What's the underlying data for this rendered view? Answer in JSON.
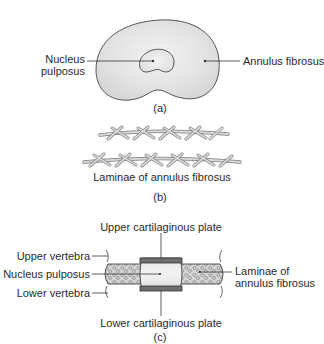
{
  "panel_a": {
    "caption": "(a)",
    "labels": {
      "nucleus_line1": "Nucleus",
      "nucleus_line2": "pulposus",
      "annulus": "Annulus fibrosus"
    },
    "colors": {
      "disc_fill": "#e6e6e6",
      "disc_stroke": "#555555",
      "nucleus_fill": "#ececec"
    }
  },
  "panel_b": {
    "caption": "(b)",
    "label": "Laminae of annulus fibrosus",
    "colors": {
      "fiber_fill": "#d9d9d9",
      "fiber_stroke": "#7a7a7a"
    }
  },
  "panel_c": {
    "caption": "(c)",
    "labels": {
      "upper_plate": "Upper cartilaginous plate",
      "lower_plate": "Lower cartilaginous plate",
      "upper_vertebra": "Upper vertebra",
      "nucleus": "Nucleus pulposus",
      "lower_vertebra": "Lower vertebra",
      "laminae_line1": "Laminae of",
      "laminae_line2": "annulus fibrosus"
    },
    "colors": {
      "plate_fill": "#6e6e6e",
      "nucleus_fill": "#dcdcdc",
      "annulus_fill": "#d2d2d2",
      "stroke": "#444444"
    }
  }
}
